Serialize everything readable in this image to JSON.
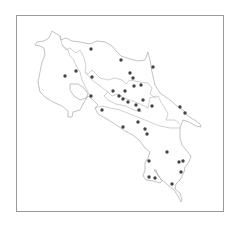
{
  "map": {
    "frame": {
      "x": 16,
      "y": 15,
      "width": 207,
      "height": 196,
      "stroke": "#999999"
    },
    "outline_color": "#a8a8a8",
    "point_color": "#444444",
    "point_radius": 1.7,
    "points": [
      [
        91,
        49
      ],
      [
        121,
        60
      ],
      [
        153,
        67
      ],
      [
        65,
        76
      ],
      [
        76,
        71
      ],
      [
        92,
        77
      ],
      [
        130,
        73
      ],
      [
        133,
        78
      ],
      [
        134,
        86
      ],
      [
        141,
        85
      ],
      [
        113,
        91
      ],
      [
        125,
        91
      ],
      [
        91,
        96
      ],
      [
        119,
        96
      ],
      [
        123,
        99
      ],
      [
        128,
        102
      ],
      [
        136,
        105
      ],
      [
        143,
        100
      ],
      [
        152,
        106
      ],
      [
        139,
        110
      ],
      [
        102,
        110
      ],
      [
        180,
        107
      ],
      [
        185,
        113
      ],
      [
        138,
        122
      ],
      [
        145,
        129
      ],
      [
        147,
        134
      ],
      [
        123,
        127
      ],
      [
        167,
        152
      ],
      [
        149,
        161
      ],
      [
        179,
        162
      ],
      [
        183,
        161
      ],
      [
        181,
        172
      ],
      [
        149,
        177
      ],
      [
        155,
        178
      ],
      [
        172,
        184
      ]
    ]
  }
}
